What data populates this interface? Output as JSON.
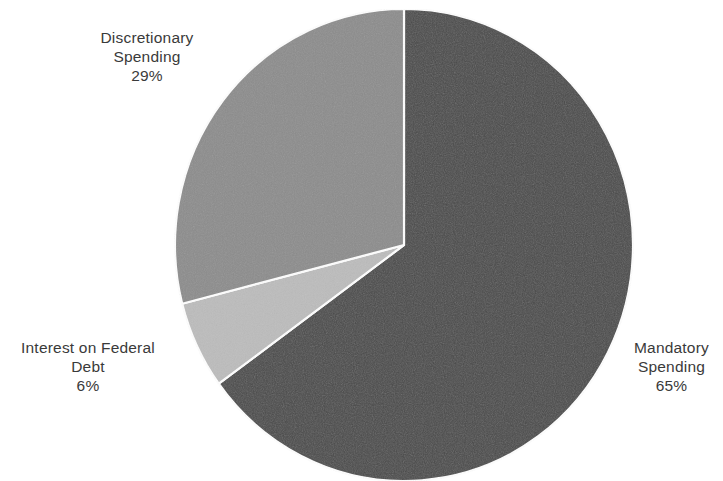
{
  "background_color": "#ffffff",
  "text_color": "#3a3a3a",
  "chart_data": {
    "type": "pie",
    "title": "",
    "subtitle": "",
    "legend_position": "none",
    "labels_inline": true,
    "start_angle_deg": 0,
    "direction": "clockwise",
    "center": {
      "x": 404,
      "y": 245
    },
    "radius": {
      "rx": 229,
      "ry": 236
    },
    "separator_color": "#ffffff",
    "categories": [
      "Mandatory Spending",
      "Discretionary Spending",
      "Interest on Federal Debt"
    ],
    "values": [
      65,
      29,
      6
    ],
    "value_unit": "%",
    "colors": [
      "#4a4a4a",
      "#8c8c8c",
      "#bcbcbc"
    ],
    "slices": [
      {
        "name": "Mandatory Spending",
        "value": 65,
        "value_label": "65%",
        "color": "#4a4a4a",
        "start_deg": 0,
        "end_deg": 234
      },
      {
        "name": "Interest on Federal Debt",
        "value": 6,
        "value_label": "6%",
        "color": "#bcbcbc",
        "start_deg": 234,
        "end_deg": 255.6
      },
      {
        "name": "Discretionary Spending",
        "value": 29,
        "value_label": "29%",
        "color": "#8c8c8c",
        "start_deg": 255.6,
        "end_deg": 360
      }
    ]
  },
  "labels": {
    "discretionary": {
      "line1": "Discretionary",
      "line2": "Spending",
      "percent": "29%"
    },
    "interest": {
      "line1": "Interest on Federal",
      "line2": "Debt",
      "percent": "6%"
    },
    "mandatory": {
      "line1": "Mandatory",
      "line2": "Spending",
      "percent": "65%"
    }
  }
}
